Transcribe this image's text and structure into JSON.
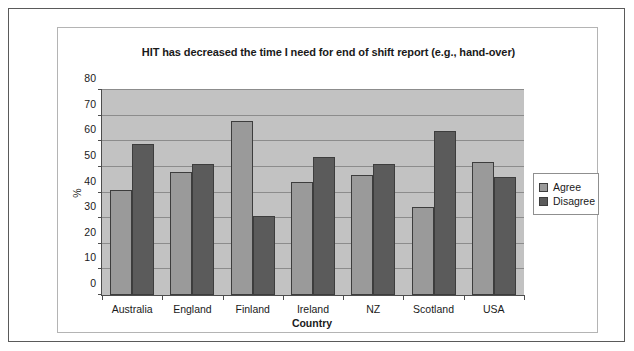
{
  "chart_data": {
    "type": "bar",
    "title": "HIT has decreased the time I need for end of shift report (e.g., hand-over)",
    "xlabel": "Country",
    "ylabel": "%",
    "categories": [
      "Australia",
      "England",
      "Finland",
      "Ireland",
      "NZ",
      "Scotland",
      "USA"
    ],
    "series": [
      {
        "name": "Agree",
        "color": "#9a9a9a",
        "values": [
          41,
          48,
          68,
          44,
          47,
          34.5,
          52
        ]
      },
      {
        "name": "Disagree",
        "color": "#5b5b5b",
        "values": [
          59,
          51,
          31,
          54,
          51,
          64,
          46
        ]
      }
    ],
    "ylim": [
      0,
      80
    ],
    "ytick_values": [
      0,
      10,
      20,
      30,
      40,
      50,
      60,
      70,
      80
    ],
    "ytick_labels": [
      "0",
      "10",
      "20",
      "30",
      "40",
      "50",
      "60",
      "70",
      "80"
    ],
    "grid": true,
    "grid_axis": "y",
    "legend_position": "right",
    "plot_background": "#c2c2c2",
    "axis_color": "#4d4d4d",
    "gridline_color": "#8c8c8c"
  }
}
